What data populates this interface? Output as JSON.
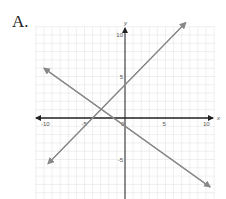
{
  "option_label": "A.",
  "top_fragment": "... y ...",
  "chart_data": {
    "type": "line",
    "title": "",
    "xlabel": "x",
    "ylabel": "y",
    "xlim": [
      -10,
      10
    ],
    "ylim": [
      -10,
      10
    ],
    "grid": true,
    "x_ticks": [
      "-10",
      "-5",
      "0",
      "5",
      "10"
    ],
    "y_ticks": [
      "10",
      "5",
      "-5",
      "-10"
    ],
    "series": [
      {
        "name": "line-increasing",
        "equation": "y = x + 4",
        "points": [
          [
            -9.5,
            -5.5
          ],
          [
            7.5,
            11.5
          ]
        ]
      },
      {
        "name": "line-decreasing",
        "equation": "y = -0.7x - 1",
        "points": [
          [
            -10,
            6
          ],
          [
            10.5,
            -8.3
          ]
        ]
      }
    ],
    "intersection": [
      -3,
      1
    ]
  }
}
